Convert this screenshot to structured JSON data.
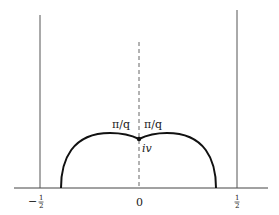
{
  "diagram": {
    "type": "fundamental-domain",
    "axis": {
      "ticks": [
        {
          "label_num": "1",
          "label_den": "2",
          "sign": "−",
          "value": -0.5
        },
        {
          "label": "0",
          "value": 0
        },
        {
          "label_num": "1",
          "label_den": "2",
          "sign": "",
          "value": 0.5
        }
      ]
    },
    "labels": {
      "angle_left": "π/q",
      "angle_right": "π/q",
      "cusp_point": "iv"
    },
    "colors": {
      "curve": "#111111",
      "lines": "#555555",
      "dashed": "#666666"
    }
  }
}
